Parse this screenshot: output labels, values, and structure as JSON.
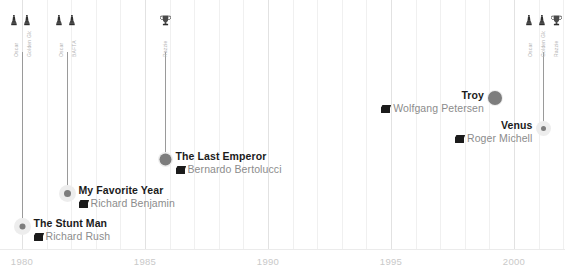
{
  "chart_data": {
    "type": "scatter",
    "title": "",
    "xlabel": "",
    "ylabel": "",
    "xlim": [
      1979,
      2007
    ],
    "ylim": [
      0,
      10
    ],
    "grid": true,
    "grid_minor_step": 1,
    "grid_major_step": 5,
    "legend": "none",
    "x_ticks": [
      "1980",
      "1985",
      "1990",
      "1995",
      "2000",
      "2005"
    ],
    "x_tick_values": [
      1980,
      1985,
      1990,
      1995,
      2000,
      2005
    ],
    "points": [
      {
        "title": "The Stunt Man",
        "director": "Richard Rush",
        "year": 1980,
        "x_px": 22,
        "y_px": 226,
        "has_stem": true,
        "stem_top_px": 52,
        "dot_size": 6,
        "halo_size": 17,
        "label_side": "right",
        "awards": [
          {
            "icon": "oscar-statuette-icon",
            "caption": "Oscar"
          },
          {
            "icon": "oscar-statuette-icon",
            "caption": "Golden Globe"
          }
        ]
      },
      {
        "title": "My Favorite Year",
        "director": "Richard Benjamin",
        "year": 1982,
        "x_px": 67,
        "y_px": 193,
        "has_stem": true,
        "stem_top_px": 52,
        "dot_size": 7,
        "halo_size": 17,
        "label_side": "right",
        "awards": [
          {
            "icon": "oscar-statuette-icon",
            "caption": "Oscar"
          },
          {
            "icon": "oscar-statuette-icon",
            "caption": "BAFTA"
          }
        ]
      },
      {
        "title": "The Last Emperor",
        "director": "Bernardo Bertolucci",
        "year": 1987,
        "x_px": 165,
        "y_px": 159,
        "has_stem": true,
        "stem_top_px": 52,
        "dot_size": 12,
        "halo_size": 15,
        "label_side": "right",
        "awards": [
          {
            "icon": "trophy-cup-icon",
            "caption": "Razzie"
          }
        ]
      },
      {
        "title": "Troy",
        "director": "Wolfgang Petersen",
        "year": 2004,
        "x_px": 495,
        "y_px": 98,
        "has_stem": false,
        "stem_top_px": 0,
        "dot_size": 14,
        "halo_size": 16,
        "label_side": "left",
        "awards": []
      },
      {
        "title": "Venus",
        "director": "Roger Michell",
        "year": 2006,
        "x_px": 543,
        "y_px": 128,
        "has_stem": true,
        "stem_top_px": 52,
        "dot_size": 5,
        "halo_size": 15,
        "label_side": "left",
        "awards": [
          {
            "icon": "oscar-statuette-icon",
            "caption": "Oscar"
          },
          {
            "icon": "oscar-statuette-icon",
            "caption": "Golden Globe"
          },
          {
            "icon": "trophy-cup-icon",
            "caption": "Razzie"
          }
        ]
      }
    ],
    "colors": {
      "dot": "#7d7d7d",
      "halo": "#ededed",
      "stem": "#9a9a9a",
      "grid_minor": "#f0f0f0",
      "grid_major": "#e2e2e2",
      "title_text": "#1b1b1b",
      "director_text": "#8c8c8c",
      "tick_text": "#c9c9c9",
      "icon": "#3a3a3a"
    }
  }
}
